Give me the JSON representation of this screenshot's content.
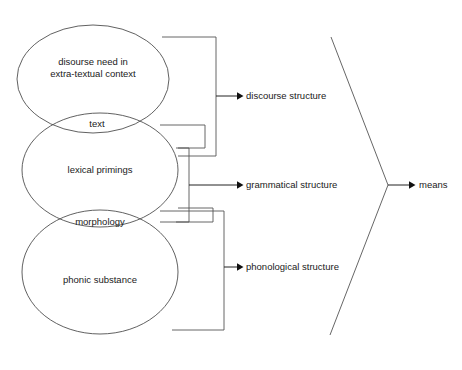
{
  "diagram": {
    "background_color": "#ffffff",
    "stroke_color": "#4f4f4f",
    "text_color": "#1a1a1a",
    "ellipses": [
      {
        "id": "discourse",
        "label_line1": "disourse need in",
        "label_line2": "extra-textual context",
        "cx": 93,
        "cy": 79,
        "rx": 76,
        "ry": 54
      },
      {
        "id": "lexical",
        "label_line1": "lexical primings",
        "label_line2": "",
        "cx": 100,
        "cy": 170,
        "rx": 78,
        "ry": 57
      },
      {
        "id": "phonic",
        "label_line1": "phonic substance",
        "label_line2": "",
        "cx": 100,
        "cy": 272,
        "rx": 78,
        "ry": 62
      }
    ],
    "intersections": [
      {
        "id": "text",
        "label": "text",
        "cx": 97,
        "cy": 124
      },
      {
        "id": "morphology",
        "label": "morphology",
        "cx": 100,
        "cy": 222
      }
    ],
    "outputs": [
      {
        "id": "discourse-structure",
        "label": "discourse structure",
        "x": 246,
        "y": 96
      },
      {
        "id": "grammatical-structure",
        "label": "grammatical structure",
        "x": 246,
        "y": 185
      },
      {
        "id": "phonological-structure",
        "label": "phonological structure",
        "x": 246,
        "y": 267
      }
    ],
    "result": {
      "id": "means",
      "label": "means",
      "x": 419,
      "y": 185
    }
  }
}
